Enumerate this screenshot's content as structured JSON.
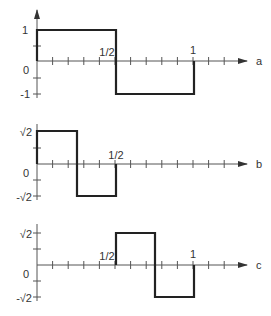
{
  "panels": [
    {
      "id": "a",
      "axis_label": "a",
      "y_top_label": "1",
      "y_bottom_label": "-1",
      "origin_label": "0",
      "x_marks": [
        {
          "label": "1/2",
          "x": 0.5
        },
        {
          "label": "1",
          "x": 1
        }
      ],
      "segments": [
        [
          0,
          1
        ],
        [
          0.5,
          1
        ],
        [
          0.5,
          -1
        ],
        [
          1,
          -1
        ],
        [
          1,
          0
        ]
      ]
    },
    {
      "id": "b",
      "axis_label": "b",
      "y_top_label": "√2",
      "y_bottom_label": "-√2",
      "origin_label": "0",
      "x_marks": [
        {
          "label": "1/2",
          "x": 0.5
        }
      ],
      "segments": [
        [
          0,
          1
        ],
        [
          0.25,
          1
        ],
        [
          0.25,
          -1
        ],
        [
          0.5,
          -1
        ],
        [
          0.5,
          0
        ]
      ]
    },
    {
      "id": "c",
      "axis_label": "c",
      "y_top_label": "√2",
      "y_bottom_label": "-√2",
      "origin_label": "0",
      "x_marks": [
        {
          "label": "1/2",
          "x": 0.5
        },
        {
          "label": "1",
          "x": 1
        }
      ],
      "segments": [
        [
          0.5,
          0
        ],
        [
          0.5,
          1
        ],
        [
          0.75,
          1
        ],
        [
          0.75,
          -1
        ],
        [
          1,
          -1
        ],
        [
          1,
          0
        ]
      ]
    }
  ]
}
